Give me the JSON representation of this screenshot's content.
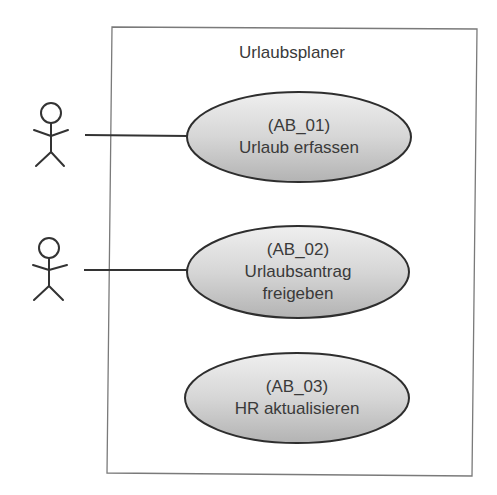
{
  "diagram": {
    "type": "use-case",
    "system": {
      "title": "Urlaubsplaner"
    },
    "actors": [
      {
        "id": "actor-1",
        "connects_to": "AB_01"
      },
      {
        "id": "actor-2",
        "connects_to": "AB_02"
      }
    ],
    "use_cases": [
      {
        "id": "AB_01",
        "line1": "(AB_01)",
        "line2": "Urlaub erfassen",
        "line3": ""
      },
      {
        "id": "AB_02",
        "line1": "(AB_02)",
        "line2": "Urlaubsantrag",
        "line3": "freigeben"
      },
      {
        "id": "AB_03",
        "line1": "(AB_03)",
        "line2": "HR aktualisieren",
        "line3": ""
      }
    ],
    "colors": {
      "stroke": "#333333",
      "box_stroke": "#777777",
      "fill_light": "#eeeeee",
      "fill_dark": "#b5b5b5"
    }
  }
}
